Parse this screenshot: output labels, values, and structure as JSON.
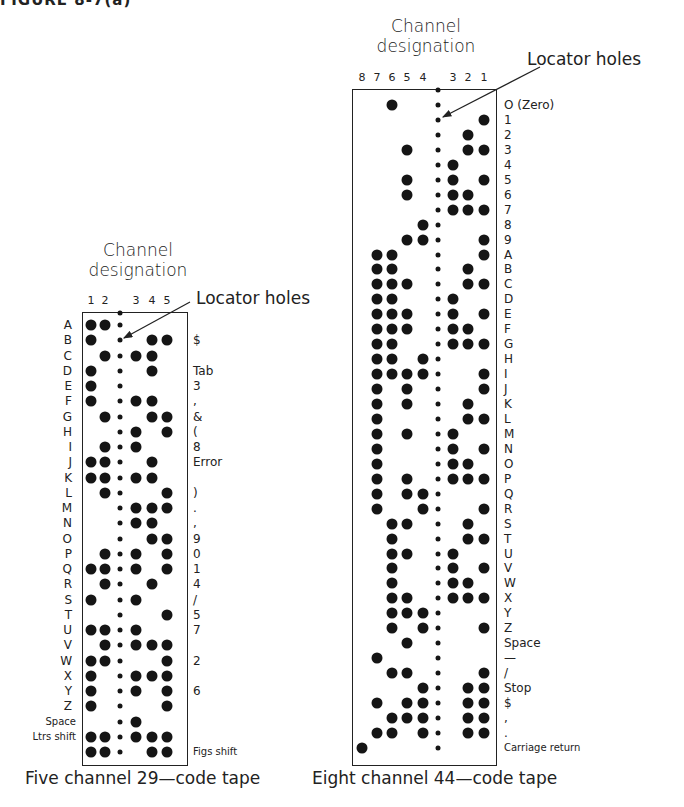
{
  "heading_cut": "FIGURE 8-7(a)",
  "five_channel": {
    "header_line1": "Channel",
    "header_line2": "designation",
    "locator_label": "Locator holes",
    "caption": "Five channel 29—code tape",
    "channel_order": [
      "1",
      "2",
      "3",
      "4",
      "5"
    ],
    "channel_x": {
      "1": 91,
      "2": 105,
      "3": 136,
      "4": 152,
      "5": 167
    },
    "locator_x": 120,
    "box": {
      "left": 82,
      "top": 312,
      "right": 188,
      "bottom": 766
    },
    "row_top": 325,
    "row_step": 15.25,
    "rows": [
      {
        "letter": "A",
        "figure": "",
        "holes": [
          "1",
          "2"
        ]
      },
      {
        "letter": "B",
        "figure": "$",
        "holes": [
          "1",
          "4",
          "5"
        ]
      },
      {
        "letter": "C",
        "figure": "",
        "holes": [
          "2",
          "3",
          "4"
        ]
      },
      {
        "letter": "D",
        "figure": "Tab",
        "holes": [
          "1",
          "4"
        ]
      },
      {
        "letter": "E",
        "figure": "3",
        "holes": [
          "1"
        ]
      },
      {
        "letter": "F",
        "figure": ",",
        "holes": [
          "1",
          "3",
          "4"
        ]
      },
      {
        "letter": "G",
        "figure": "&",
        "holes": [
          "2",
          "4",
          "5"
        ]
      },
      {
        "letter": "H",
        "figure": "(",
        "holes": [
          "3",
          "5"
        ]
      },
      {
        "letter": "I",
        "figure": "8",
        "holes": [
          "2",
          "3"
        ]
      },
      {
        "letter": "J",
        "figure": "Error",
        "holes": [
          "1",
          "2",
          "4"
        ]
      },
      {
        "letter": "K",
        "figure": "",
        "holes": [
          "1",
          "2",
          "3",
          "4"
        ]
      },
      {
        "letter": "L",
        "figure": ")",
        "holes": [
          "2",
          "5"
        ]
      },
      {
        "letter": "M",
        "figure": ".",
        "holes": [
          "3",
          "4",
          "5"
        ]
      },
      {
        "letter": "N",
        "figure": ",",
        "holes": [
          "3",
          "4"
        ]
      },
      {
        "letter": "O",
        "figure": "9",
        "holes": [
          "4",
          "5"
        ]
      },
      {
        "letter": "P",
        "figure": "0",
        "holes": [
          "2",
          "3",
          "5"
        ]
      },
      {
        "letter": "Q",
        "figure": "1",
        "holes": [
          "1",
          "2",
          "3",
          "5"
        ]
      },
      {
        "letter": "R",
        "figure": "4",
        "holes": [
          "2",
          "4"
        ]
      },
      {
        "letter": "S",
        "figure": "/",
        "holes": [
          "1",
          "3"
        ]
      },
      {
        "letter": "T",
        "figure": "5",
        "holes": [
          "5"
        ]
      },
      {
        "letter": "U",
        "figure": "7",
        "holes": [
          "1",
          "2",
          "3"
        ]
      },
      {
        "letter": "V",
        "figure": "",
        "holes": [
          "2",
          "3",
          "4",
          "5"
        ]
      },
      {
        "letter": "W",
        "figure": "2",
        "holes": [
          "1",
          "2",
          "5"
        ]
      },
      {
        "letter": "X",
        "figure": "",
        "holes": [
          "1",
          "3",
          "4",
          "5"
        ]
      },
      {
        "letter": "Y",
        "figure": "6",
        "holes": [
          "1",
          "3",
          "5"
        ]
      },
      {
        "letter": "Z",
        "figure": "",
        "holes": [
          "1",
          "5"
        ]
      },
      {
        "letter": "Space",
        "figure": "",
        "holes": [
          "3"
        ]
      },
      {
        "letter": "Ltrs shift",
        "figure": "",
        "holes": [
          "1",
          "2",
          "3",
          "4",
          "5"
        ]
      },
      {
        "letter": "",
        "figure": "Figs shift",
        "holes": [
          "1",
          "2",
          "4",
          "5"
        ]
      }
    ]
  },
  "eight_channel": {
    "header_line1": "Channel",
    "header_line2": "designation",
    "locator_label": "Locator holes",
    "caption": "Eight channel 44—code tape",
    "channel_order": [
      "8",
      "7",
      "6",
      "5",
      "4",
      "3",
      "2",
      "1"
    ],
    "channel_x": {
      "8": 362,
      "7": 377,
      "6": 392,
      "5": 407,
      "4": 423,
      "3": 453,
      "2": 468,
      "1": 484
    },
    "locator_x": 438,
    "box": {
      "left": 352,
      "top": 89,
      "right": 497,
      "bottom": 766
    },
    "row_top": 105,
    "row_step": 14.95,
    "rows": [
      {
        "label": "O (Zero)",
        "holes": [
          "6"
        ]
      },
      {
        "label": "1",
        "holes": [
          "1"
        ]
      },
      {
        "label": "2",
        "holes": [
          "2"
        ]
      },
      {
        "label": "3",
        "holes": [
          "5",
          "2",
          "1"
        ]
      },
      {
        "label": "4",
        "holes": [
          "3"
        ]
      },
      {
        "label": "5",
        "holes": [
          "5",
          "3",
          "1"
        ]
      },
      {
        "label": "6",
        "holes": [
          "5",
          "3",
          "2"
        ]
      },
      {
        "label": "7",
        "holes": [
          "3",
          "2",
          "1"
        ]
      },
      {
        "label": "8",
        "holes": [
          "4"
        ]
      },
      {
        "label": "9",
        "holes": [
          "5",
          "4",
          "1"
        ]
      },
      {
        "label": "A",
        "holes": [
          "7",
          "6",
          "1"
        ]
      },
      {
        "label": "B",
        "holes": [
          "7",
          "6",
          "2"
        ]
      },
      {
        "label": "C",
        "holes": [
          "7",
          "6",
          "5",
          "2",
          "1"
        ]
      },
      {
        "label": "D",
        "holes": [
          "7",
          "6",
          "3"
        ]
      },
      {
        "label": "E",
        "holes": [
          "7",
          "6",
          "5",
          "3",
          "1"
        ]
      },
      {
        "label": "F",
        "holes": [
          "7",
          "6",
          "5",
          "3",
          "2"
        ]
      },
      {
        "label": "G",
        "holes": [
          "7",
          "6",
          "3",
          "2",
          "1"
        ]
      },
      {
        "label": "H",
        "holes": [
          "7",
          "6",
          "4"
        ]
      },
      {
        "label": "I",
        "holes": [
          "7",
          "6",
          "5",
          "4",
          "1"
        ]
      },
      {
        "label": "J",
        "holes": [
          "7",
          "5",
          "1"
        ]
      },
      {
        "label": "K",
        "holes": [
          "7",
          "5",
          "2"
        ]
      },
      {
        "label": "L",
        "holes": [
          "7",
          "2",
          "1"
        ]
      },
      {
        "label": "M",
        "holes": [
          "7",
          "5",
          "3"
        ]
      },
      {
        "label": "N",
        "holes": [
          "7",
          "3",
          "1"
        ]
      },
      {
        "label": "O",
        "holes": [
          "7",
          "3",
          "2"
        ]
      },
      {
        "label": "P",
        "holes": [
          "7",
          "5",
          "3",
          "2",
          "1"
        ]
      },
      {
        "label": "Q",
        "holes": [
          "7",
          "5",
          "4"
        ]
      },
      {
        "label": "R",
        "holes": [
          "7",
          "4",
          "1"
        ]
      },
      {
        "label": "S",
        "holes": [
          "6",
          "5",
          "2"
        ]
      },
      {
        "label": "T",
        "holes": [
          "6",
          "2",
          "1"
        ]
      },
      {
        "label": "U",
        "holes": [
          "6",
          "5",
          "3"
        ]
      },
      {
        "label": "V",
        "holes": [
          "6",
          "3",
          "1"
        ]
      },
      {
        "label": "W",
        "holes": [
          "6",
          "3",
          "2"
        ]
      },
      {
        "label": "X",
        "holes": [
          "6",
          "5",
          "3",
          "2",
          "1"
        ]
      },
      {
        "label": "Y",
        "holes": [
          "6",
          "5",
          "4"
        ]
      },
      {
        "label": "Z",
        "holes": [
          "6",
          "4",
          "1"
        ]
      },
      {
        "label": "Space",
        "holes": [
          "5"
        ]
      },
      {
        "label": "—",
        "holes": [
          "7"
        ]
      },
      {
        "label": "/",
        "holes": [
          "6",
          "5",
          "1"
        ]
      },
      {
        "label": "Stop",
        "holes": [
          "4",
          "2",
          "1"
        ]
      },
      {
        "label": "$",
        "holes": [
          "7",
          "5",
          "4",
          "2",
          "1"
        ]
      },
      {
        "label": ",",
        "holes": [
          "6",
          "5",
          "4",
          "2",
          "1"
        ]
      },
      {
        "label": ".",
        "holes": [
          "7",
          "6",
          "4",
          "2",
          "1"
        ]
      },
      {
        "label": "Carriage return",
        "holes": [
          "8"
        ]
      }
    ]
  }
}
